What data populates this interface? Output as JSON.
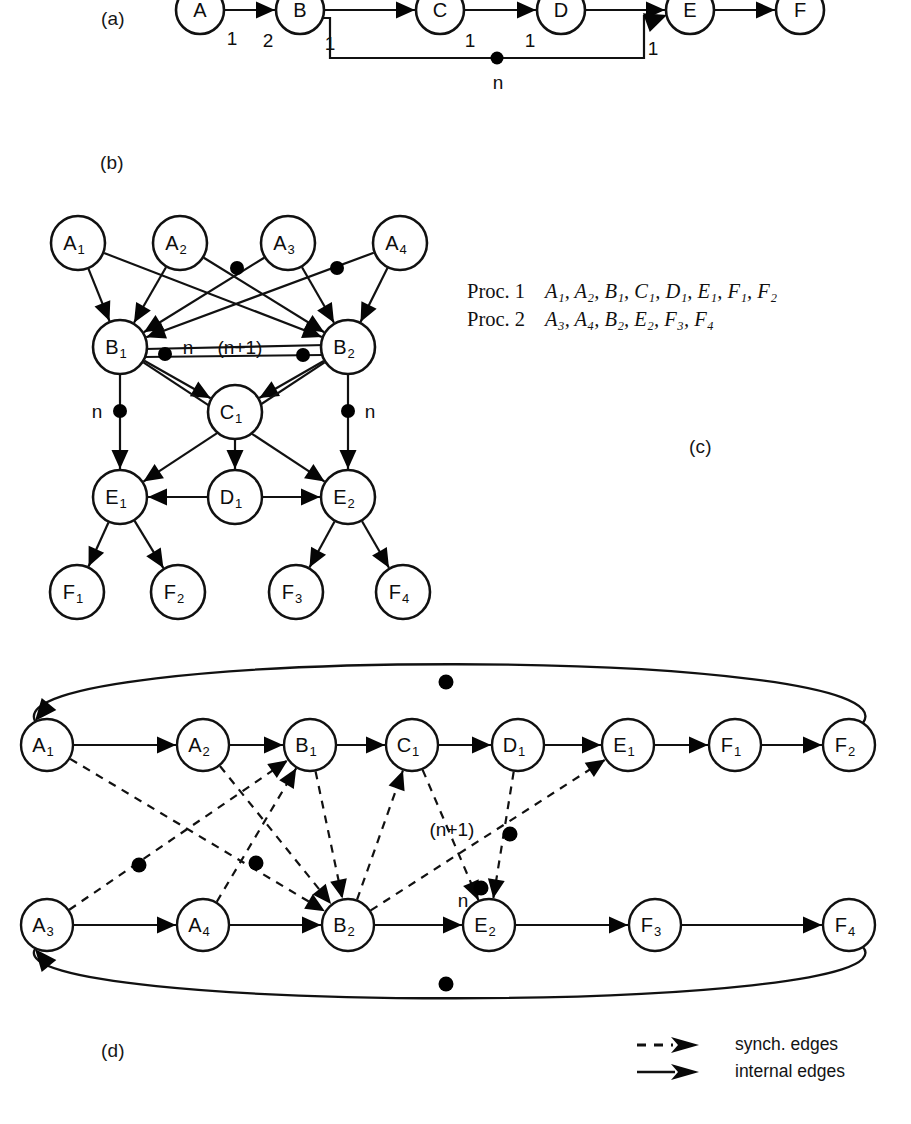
{
  "panels": {
    "a": {
      "label": "(a)"
    },
    "b": {
      "label": "(b)"
    },
    "c": {
      "label": "(c)"
    },
    "d": {
      "label": "(d)"
    }
  },
  "diagram_a": {
    "nodes": [
      {
        "id": "A",
        "label": "A",
        "cx": 200,
        "cy": 10,
        "r": 24
      },
      {
        "id": "B",
        "label": "B",
        "cx": 300,
        "cy": 10,
        "r": 24
      },
      {
        "id": "C",
        "label": "C",
        "cx": 440,
        "cy": 10,
        "r": 24
      },
      {
        "id": "D",
        "label": "D",
        "cx": 561,
        "cy": 10,
        "r": 24
      },
      {
        "id": "E",
        "label": "E",
        "cx": 690,
        "cy": 10,
        "r": 24
      },
      {
        "id": "F",
        "label": "F",
        "cx": 800,
        "cy": 10,
        "r": 24
      }
    ],
    "edge_labels": [
      {
        "text": "1",
        "x": 232,
        "y": 38
      },
      {
        "text": "2",
        "x": 268,
        "y": 40
      },
      {
        "text": "1",
        "x": 330,
        "y": 43
      },
      {
        "text": "1",
        "x": 470,
        "y": 40
      },
      {
        "text": "1",
        "x": 530,
        "y": 40
      },
      {
        "text": "1",
        "x": 653,
        "y": 48
      },
      {
        "text": "n",
        "x": 498,
        "y": 82
      }
    ],
    "tokens": [
      {
        "x": 497,
        "y": 58,
        "r": 6.5
      }
    ]
  },
  "diagram_b": {
    "nodes": [
      {
        "id": "A1",
        "base": "A",
        "sub": "1",
        "cx": 78,
        "cy": 243,
        "r": 27
      },
      {
        "id": "A2",
        "base": "A",
        "sub": "2",
        "cx": 180,
        "cy": 243,
        "r": 27
      },
      {
        "id": "A3",
        "base": "A",
        "sub": "3",
        "cx": 288,
        "cy": 243,
        "r": 27
      },
      {
        "id": "A4",
        "base": "A",
        "sub": "4",
        "cx": 400,
        "cy": 243,
        "r": 27
      },
      {
        "id": "B1",
        "base": "B",
        "sub": "1",
        "cx": 120,
        "cy": 347,
        "r": 27
      },
      {
        "id": "B2",
        "base": "B",
        "sub": "2",
        "cx": 348,
        "cy": 347,
        "r": 27
      },
      {
        "id": "C1",
        "base": "C",
        "sub": "1",
        "cx": 235,
        "cy": 412,
        "r": 27
      },
      {
        "id": "D1",
        "base": "D",
        "sub": "1",
        "cx": 235,
        "cy": 497,
        "r": 27
      },
      {
        "id": "E1",
        "base": "E",
        "sub": "1",
        "cx": 120,
        "cy": 497,
        "r": 27
      },
      {
        "id": "E2",
        "base": "E",
        "sub": "2",
        "cx": 348,
        "cy": 497,
        "r": 27
      },
      {
        "id": "F1",
        "base": "F",
        "sub": "1",
        "cx": 77,
        "cy": 592,
        "r": 27
      },
      {
        "id": "F2",
        "base": "F",
        "sub": "2",
        "cx": 178,
        "cy": 592,
        "r": 27
      },
      {
        "id": "F3",
        "base": "F",
        "sub": "3",
        "cx": 296,
        "cy": 592,
        "r": 27
      },
      {
        "id": "F4",
        "base": "F",
        "sub": "4",
        "cx": 403,
        "cy": 592,
        "r": 27
      }
    ],
    "edges": [
      {
        "from": "A1",
        "to": "B1"
      },
      {
        "from": "A1",
        "to": "B2"
      },
      {
        "from": "A2",
        "to": "B1"
      },
      {
        "from": "A2",
        "to": "B2"
      },
      {
        "from": "A3",
        "to": "B1"
      },
      {
        "from": "A3",
        "to": "B2"
      },
      {
        "from": "A4",
        "to": "B1"
      },
      {
        "from": "A4",
        "to": "B2"
      },
      {
        "from": "B1",
        "to": "B2"
      },
      {
        "from": "B2",
        "to": "B1"
      },
      {
        "from": "B1",
        "to": "C1"
      },
      {
        "from": "B2",
        "to": "C1"
      },
      {
        "from": "B1",
        "to": "E1"
      },
      {
        "from": "B1",
        "to": "E2"
      },
      {
        "from": "B2",
        "to": "E1"
      },
      {
        "from": "B2",
        "to": "E2"
      },
      {
        "from": "C1",
        "to": "D1"
      },
      {
        "from": "D1",
        "to": "E1"
      },
      {
        "from": "D1",
        "to": "E2"
      },
      {
        "from": "E1",
        "to": "F1"
      },
      {
        "from": "E1",
        "to": "F2"
      },
      {
        "from": "E2",
        "to": "F3"
      },
      {
        "from": "E2",
        "to": "F4"
      }
    ],
    "tokens": [
      {
        "x": 237,
        "y": 268,
        "r": 7
      },
      {
        "x": 337,
        "y": 268,
        "r": 7
      },
      {
        "x": 165,
        "y": 354,
        "r": 7
      },
      {
        "x": 303,
        "y": 355,
        "r": 7
      },
      {
        "x": 120,
        "y": 411,
        "r": 7
      },
      {
        "x": 348,
        "y": 411,
        "r": 7
      }
    ],
    "annotations": [
      {
        "text": "n",
        "x": 188,
        "y": 347
      },
      {
        "text": "(n+1)",
        "x": 240,
        "y": 347
      },
      {
        "text": "n",
        "x": 97,
        "y": 411
      },
      {
        "text": "n",
        "x": 370,
        "y": 411
      }
    ]
  },
  "diagram_c": {
    "rows": [
      {
        "name": "Proc. 1",
        "sequence": "A₁, A₂, B₁, C₁, D₁, E₁, F₁, F₂"
      },
      {
        "name": "Proc. 2",
        "sequence": "A₃, A₄, B₂, E₂, F₃, F₄"
      }
    ]
  },
  "diagram_d": {
    "nodes": [
      {
        "id": "A1",
        "base": "A",
        "sub": "1",
        "cx": 47,
        "cy": 745,
        "r": 26
      },
      {
        "id": "A2",
        "base": "A",
        "sub": "2",
        "cx": 203,
        "cy": 745,
        "r": 26
      },
      {
        "id": "B1",
        "base": "B",
        "sub": "1",
        "cx": 310,
        "cy": 745,
        "r": 26
      },
      {
        "id": "C1",
        "base": "C",
        "sub": "1",
        "cx": 412,
        "cy": 745,
        "r": 26
      },
      {
        "id": "D1",
        "base": "D",
        "sub": "1",
        "cx": 518,
        "cy": 745,
        "r": 26
      },
      {
        "id": "E1",
        "base": "E",
        "sub": "1",
        "cx": 628,
        "cy": 745,
        "r": 26
      },
      {
        "id": "F1",
        "base": "F",
        "sub": "1",
        "cx": 735,
        "cy": 745,
        "r": 26
      },
      {
        "id": "F2",
        "base": "F",
        "sub": "2",
        "cx": 849,
        "cy": 745,
        "r": 26
      },
      {
        "id": "A3",
        "base": "A",
        "sub": "3",
        "cx": 47,
        "cy": 925,
        "r": 26
      },
      {
        "id": "A4",
        "base": "A",
        "sub": "4",
        "cx": 203,
        "cy": 925,
        "r": 26
      },
      {
        "id": "B2",
        "base": "B",
        "sub": "2",
        "cx": 348,
        "cy": 925,
        "r": 26
      },
      {
        "id": "E2",
        "base": "E",
        "sub": "2",
        "cx": 489,
        "cy": 925,
        "r": 26
      },
      {
        "id": "F3",
        "base": "F",
        "sub": "3",
        "cx": 655,
        "cy": 925,
        "r": 26
      },
      {
        "id": "F4",
        "base": "F",
        "sub": "4",
        "cx": 849,
        "cy": 925,
        "r": 26
      }
    ],
    "internal_edges": [
      {
        "from": "A1",
        "to": "A2"
      },
      {
        "from": "A2",
        "to": "B1"
      },
      {
        "from": "B1",
        "to": "C1"
      },
      {
        "from": "C1",
        "to": "D1"
      },
      {
        "from": "D1",
        "to": "E1"
      },
      {
        "from": "E1",
        "to": "F1"
      },
      {
        "from": "F1",
        "to": "F2"
      },
      {
        "from": "A3",
        "to": "A4"
      },
      {
        "from": "A4",
        "to": "B2"
      },
      {
        "from": "B2",
        "to": "E2"
      },
      {
        "from": "E2",
        "to": "F3"
      },
      {
        "from": "F3",
        "to": "F4"
      }
    ],
    "synch_edges": [
      {
        "from": "A1",
        "to": "B2"
      },
      {
        "from": "A2",
        "to": "B2"
      },
      {
        "from": "A3",
        "to": "B1"
      },
      {
        "from": "A4",
        "to": "B1"
      },
      {
        "from": "B1",
        "to": "B2"
      },
      {
        "from": "B2",
        "to": "C1"
      },
      {
        "from": "B2",
        "to": "E1"
      },
      {
        "from": "D1",
        "to": "E2"
      },
      {
        "from": "C1",
        "to": "E2"
      }
    ],
    "feedback_edges": [
      {
        "from": "F2",
        "to": "A1",
        "side": "top"
      },
      {
        "from": "F4",
        "to": "A3",
        "side": "bottom"
      }
    ],
    "tokens": [
      {
        "x": 446,
        "y": 682,
        "r": 7.5
      },
      {
        "x": 446,
        "y": 984,
        "r": 7.5
      },
      {
        "x": 139,
        "y": 865,
        "r": 7.5
      },
      {
        "x": 256,
        "y": 863,
        "r": 7.5
      },
      {
        "x": 510,
        "y": 834,
        "r": 7.5
      },
      {
        "x": 481,
        "y": 888,
        "r": 7.5
      }
    ],
    "annotations": [
      {
        "text": "(n+1)",
        "x": 452,
        "y": 829
      },
      {
        "text": "n",
        "x": 463,
        "y": 900
      }
    ]
  },
  "legend": {
    "items": [
      {
        "style": "dashed",
        "label": "synch. edges"
      },
      {
        "style": "solid",
        "label": "internal edges"
      }
    ]
  },
  "colors": {
    "ink": "#111111",
    "paper": "#ffffff"
  }
}
